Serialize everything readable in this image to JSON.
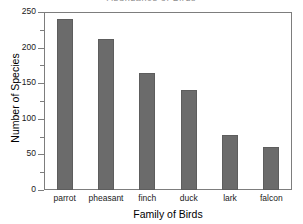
{
  "chart_data": {
    "type": "bar",
    "title": "",
    "categories": [
      "parrot",
      "pheasant",
      "finch",
      "duck",
      "lark",
      "falcon"
    ],
    "values": [
      240,
      212,
      165,
      141,
      77,
      61
    ],
    "xlabel": "Family of Birds",
    "ylabel": "Number of Species",
    "ylim": [
      0,
      250
    ],
    "ytick_labels": [
      "0",
      "50",
      "100",
      "150",
      "200",
      "250"
    ],
    "ytick_values": [
      0,
      50,
      100,
      150,
      200,
      250
    ],
    "ytick_minor_values": [
      25,
      75,
      125,
      175,
      225
    ],
    "grid": false,
    "legend": null,
    "bar_color": "#6b6b6b",
    "axis_color": "#7d7d7d",
    "text_color": "#1a1a1a"
  },
  "title_clipped": "Abundance of Birds"
}
